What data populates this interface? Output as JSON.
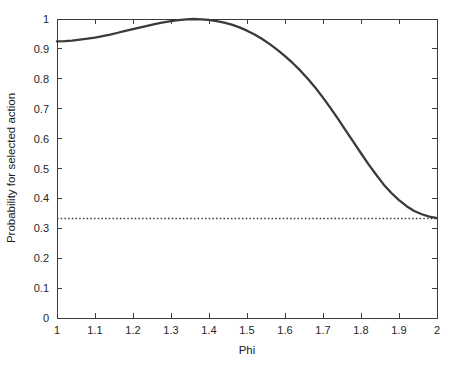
{
  "chart_data": {
    "type": "line",
    "title": "",
    "xlabel": "Phi",
    "ylabel": "Probability for selected action",
    "xlim": [
      1,
      2
    ],
    "ylim": [
      0,
      1
    ],
    "grid": false,
    "legend": "none",
    "xticks": [
      "1",
      "1.1",
      "1.2",
      "1.3",
      "1.4",
      "1.5",
      "1.6",
      "1.7",
      "1.8",
      "1.9",
      "2"
    ],
    "xtick_values": [
      1,
      1.1,
      1.2,
      1.3,
      1.4,
      1.5,
      1.6,
      1.7,
      1.8,
      1.9,
      2
    ],
    "yticks": [
      "0",
      "0.1",
      "0.2",
      "0.3",
      "0.4",
      "0.5",
      "0.6",
      "0.7",
      "0.8",
      "0.9",
      "1"
    ],
    "ytick_values": [
      0,
      0.1,
      0.2,
      0.3,
      0.4,
      0.5,
      0.6,
      0.7,
      0.8,
      0.9,
      1
    ],
    "series": [
      {
        "name": "probability-curve",
        "style": "solid",
        "color": "#3a3a3a",
        "x": [
          1.0,
          1.02,
          1.04,
          1.06,
          1.08,
          1.1,
          1.12,
          1.14,
          1.16,
          1.18,
          1.2,
          1.22,
          1.24,
          1.26,
          1.28,
          1.3,
          1.32,
          1.34,
          1.36,
          1.38,
          1.4,
          1.42,
          1.44,
          1.46,
          1.48,
          1.5,
          1.52,
          1.54,
          1.56,
          1.58,
          1.6,
          1.62,
          1.64,
          1.66,
          1.68,
          1.7,
          1.72,
          1.74,
          1.76,
          1.78,
          1.8,
          1.82,
          1.84,
          1.86,
          1.88,
          1.9,
          1.92,
          1.94,
          1.96,
          1.98,
          2.0
        ],
        "values": [
          0.925,
          0.926,
          0.928,
          0.931,
          0.934,
          0.938,
          0.943,
          0.948,
          0.954,
          0.96,
          0.966,
          0.972,
          0.978,
          0.984,
          0.989,
          0.993,
          0.996,
          0.999,
          1.0,
          0.999,
          0.997,
          0.993,
          0.988,
          0.981,
          0.972,
          0.961,
          0.948,
          0.933,
          0.916,
          0.897,
          0.876,
          0.853,
          0.828,
          0.8,
          0.77,
          0.737,
          0.702,
          0.665,
          0.627,
          0.589,
          0.551,
          0.514,
          0.479,
          0.446,
          0.418,
          0.394,
          0.374,
          0.358,
          0.347,
          0.339,
          0.334
        ]
      },
      {
        "name": "chance-baseline",
        "style": "dotted",
        "color": "#3a3a3a",
        "x": [
          1,
          2
        ],
        "values": [
          0.333,
          0.333
        ]
      }
    ]
  }
}
